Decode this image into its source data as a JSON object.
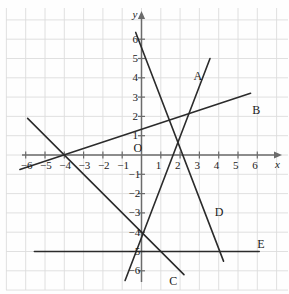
{
  "figure": {
    "kind": "coordinate-grid-line-graph",
    "background_color": "#fefefe",
    "grid_color": "#dcdcdc",
    "grid_minor_color": "#e8e4e4",
    "axis_color": "#6b6b6b",
    "line_color": "#2b2b2b",
    "origin_label": "O",
    "x_axis_name": "x",
    "y_axis_name": "y"
  },
  "axes": {
    "x_ticks": [
      {
        "value": -6,
        "label": "−6"
      },
      {
        "value": -5,
        "label": "−5"
      },
      {
        "value": -4,
        "label": "−4"
      },
      {
        "value": -3,
        "label": "−3"
      },
      {
        "value": -2,
        "label": "−2"
      },
      {
        "value": -1,
        "label": "−1"
      },
      {
        "value": 1,
        "label": "1"
      },
      {
        "value": 2,
        "label": "2"
      },
      {
        "value": 3,
        "label": "3"
      },
      {
        "value": 4,
        "label": "4"
      },
      {
        "value": 5,
        "label": "5"
      },
      {
        "value": 6,
        "label": "6"
      }
    ],
    "y_ticks": [
      {
        "value": 6,
        "label": "6"
      },
      {
        "value": 5,
        "label": "5"
      },
      {
        "value": 4,
        "label": "4"
      },
      {
        "value": 3,
        "label": "3"
      },
      {
        "value": 2,
        "label": "2"
      },
      {
        "value": 1,
        "label": "1"
      },
      {
        "value": -1,
        "label": "−1"
      },
      {
        "value": -2,
        "label": "−2"
      },
      {
        "value": -3,
        "label": "−3"
      },
      {
        "value": -4,
        "label": "−4"
      },
      {
        "value": -5,
        "label": "−5"
      },
      {
        "value": -6,
        "label": "−6"
      }
    ]
  },
  "chart_data": {
    "type": "line",
    "title": "",
    "xlabel": "x",
    "ylabel": "y",
    "xlim": [
      -7,
      7
    ],
    "ylim": [
      -7,
      7
    ],
    "grid": true,
    "legend": "inline-end-labels",
    "series": [
      {
        "name": "A",
        "label": "A",
        "label_point": {
          "x": 2.9,
          "y": 4.1
        },
        "approx_equation": "y = 4x - 3",
        "slope": 4.0,
        "y_intercept": -3.0,
        "x_intercept": 0.75,
        "endpoints": [
          {
            "x": -0.85,
            "y": -6.5
          },
          {
            "x": 3.55,
            "y": 5.0
          }
        ]
      },
      {
        "name": "B",
        "label": "B",
        "label_point": {
          "x": 5.95,
          "y": 2.35
        },
        "approx_equation": "y = 0.33x + 1.33",
        "slope": 0.33,
        "y_intercept": 1.33,
        "x_intercept": -4.0,
        "endpoints": [
          {
            "x": -6.3,
            "y": -0.75
          },
          {
            "x": 5.65,
            "y": 3.2
          }
        ]
      },
      {
        "name": "C",
        "label": "C",
        "label_point": {
          "x": 1.65,
          "y": -6.55
        },
        "approx_equation": "y = -x - 4",
        "slope": -1.0,
        "y_intercept": -4.0,
        "x_intercept": -4.0,
        "endpoints": [
          {
            "x": -5.9,
            "y": 1.9
          },
          {
            "x": 2.2,
            "y": -6.2
          }
        ]
      },
      {
        "name": "D",
        "label": "D",
        "label_point": {
          "x": 4.0,
          "y": -2.95
        },
        "approx_equation": "y = -2.6x + 5.5",
        "slope": -2.6,
        "y_intercept": 5.5,
        "x_intercept": 2.1,
        "endpoints": [
          {
            "x": -0.3,
            "y": 6.35
          },
          {
            "x": 4.25,
            "y": -5.5
          }
        ]
      },
      {
        "name": "E",
        "label": "E",
        "label_point": {
          "x": 6.2,
          "y": -4.6
        },
        "approx_equation": "y = -5",
        "slope": 0.0,
        "y_intercept": -5.0,
        "x_intercept": null,
        "endpoints": [
          {
            "x": -5.55,
            "y": -5.0
          },
          {
            "x": 6.1,
            "y": -5.0
          }
        ]
      }
    ]
  }
}
